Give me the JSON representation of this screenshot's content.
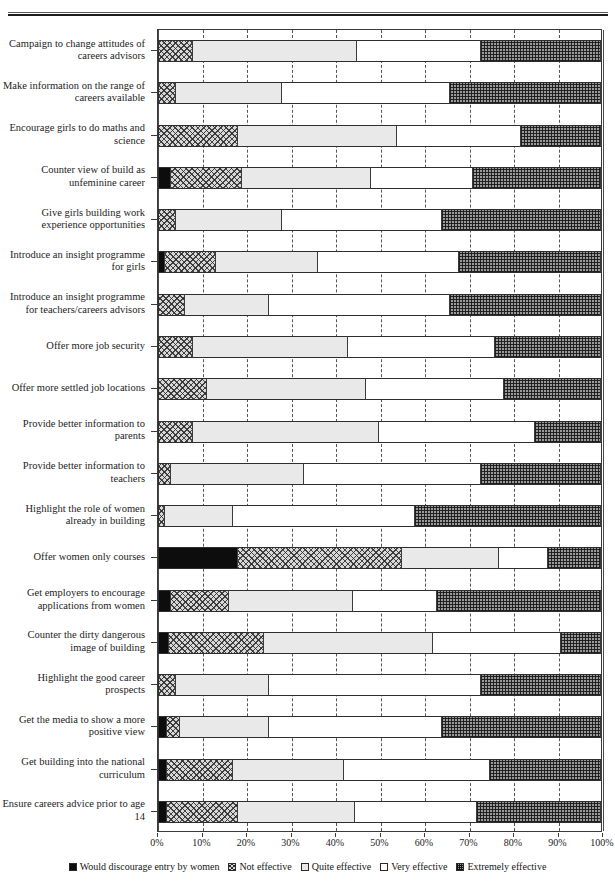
{
  "page": {
    "header_fragment": "",
    "rule": "horizontal-rule"
  },
  "chart_data": {
    "type": "bar",
    "orientation": "horizontal",
    "stacked": true,
    "normalized_percent": true,
    "title": "",
    "subtitle": "",
    "xlabel": "",
    "ylabel": "",
    "xlim": [
      0,
      100
    ],
    "xtick_labels": [
      "0%",
      "10%",
      "20%",
      "30%",
      "40%",
      "50%",
      "60%",
      "70%",
      "80%",
      "90%",
      "100%"
    ],
    "xticks": [
      0,
      10,
      20,
      30,
      40,
      50,
      60,
      70,
      80,
      90,
      100
    ],
    "grid": "vertical-dashed",
    "legend_position": "bottom",
    "categories": [
      "Campaign to change attitudes of careers advisors",
      "Make information on the range of careers available",
      "Encourage girls to do maths and science",
      "Counter view of build as unfeminine career",
      "Give girls building work experience opportunities",
      "Introduce an insight programme for girls",
      "Introduce an insight programme for teachers/careers advisors",
      "Offer more job security",
      "Offer more settled job locations",
      "Provide better information to parents",
      "Provide better information to teachers",
      "Highlight the role of women already in building",
      "Offer women only courses",
      "Get employers to encourage applications from women",
      "Counter the dirty dangerous image of building",
      "Highlight the good career prospects",
      "Get the media to show a more positive view",
      "Get building into the national curriculum",
      "Ensure careers advice prior to age 14"
    ],
    "series": [
      {
        "name": "Would discourage entry by women",
        "key": "discourage",
        "fill": "solid-black",
        "color": "#0d0d0d",
        "values": [
          0,
          0,
          0,
          3.0,
          0,
          1.5,
          0,
          0,
          0,
          0,
          0,
          0,
          18.0,
          3.0,
          2.5,
          0,
          2.0,
          2.0,
          2.0
        ]
      },
      {
        "name": "Not effective",
        "key": "not_effective",
        "fill": "diagonal-crosshatch",
        "color": "#d8d8d8",
        "values": [
          8.0,
          4.0,
          18.0,
          16.0,
          4.0,
          11.5,
          6.0,
          8.0,
          11.0,
          8.0,
          3.0,
          1.5,
          37.0,
          13.0,
          21.5,
          4.0,
          3.0,
          15.0,
          16.0
        ]
      },
      {
        "name": "Quite effective",
        "key": "quite_effective",
        "fill": "light-grey",
        "color": "#e9e9e9",
        "values": [
          37.0,
          24.0,
          36.0,
          29.0,
          24.0,
          23.0,
          19.0,
          35.0,
          36.0,
          42.0,
          30.0,
          15.5,
          22.0,
          28.0,
          38.0,
          21.0,
          20.0,
          25.0,
          26.5
        ]
      },
      {
        "name": "Very effective",
        "key": "very_effective",
        "fill": "white",
        "color": "#ffffff",
        "values": [
          28.0,
          38.0,
          28.0,
          23.0,
          36.0,
          32.0,
          41.0,
          33.0,
          31.0,
          35.0,
          40.0,
          41.0,
          11.0,
          19.0,
          29.0,
          48.0,
          39.0,
          33.0,
          27.5
        ]
      },
      {
        "name": "Extremely effective",
        "key": "extremely_effective",
        "fill": "dense-checker",
        "color": "#9a9a9a",
        "values": [
          27.0,
          34.0,
          18.0,
          29.0,
          36.0,
          32.0,
          34.0,
          24.0,
          22.0,
          15.0,
          27.0,
          42.0,
          12.0,
          37.0,
          9.0,
          27.0,
          36.0,
          25.0,
          28.0
        ]
      }
    ]
  }
}
